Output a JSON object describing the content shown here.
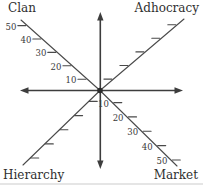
{
  "figure": {
    "corners": {
      "top_left": "Clan",
      "top_right": "Adhocracy",
      "bottom_left": "Hierarchy",
      "bottom_right": "Market"
    },
    "clan_ticks": [
      "10",
      "20",
      "30",
      "40",
      "50"
    ],
    "market_ticks": [
      "10",
      "20",
      "30",
      "40",
      "50"
    ],
    "colors": {
      "ink": "#3d3d3d",
      "text": "#2f2f2f",
      "background": "#ffffff"
    }
  }
}
